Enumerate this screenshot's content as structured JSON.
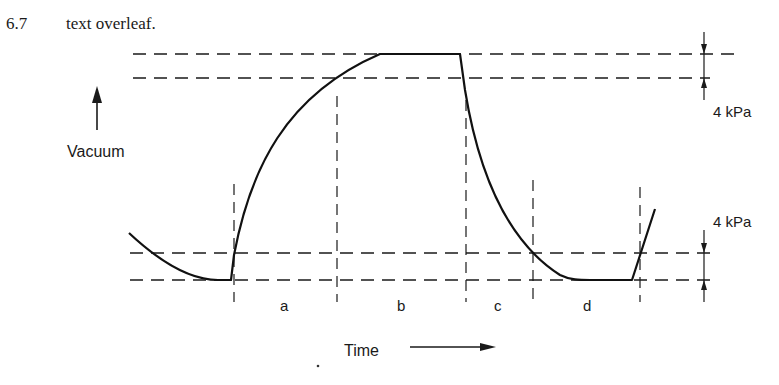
{
  "header": {
    "figure_number": "6.7",
    "caption": "text overleaf."
  },
  "axes": {
    "y_label": "Vacuum",
    "x_label": "Time"
  },
  "annotations": {
    "upper_band": "4 kPa",
    "lower_band": "4 kPa"
  },
  "phases": [
    {
      "label": "a"
    },
    {
      "label": "b"
    },
    {
      "label": "c"
    },
    {
      "label": "d"
    }
  ],
  "colors": {
    "ink": "#1a1a1a",
    "background": "#ffffff"
  }
}
